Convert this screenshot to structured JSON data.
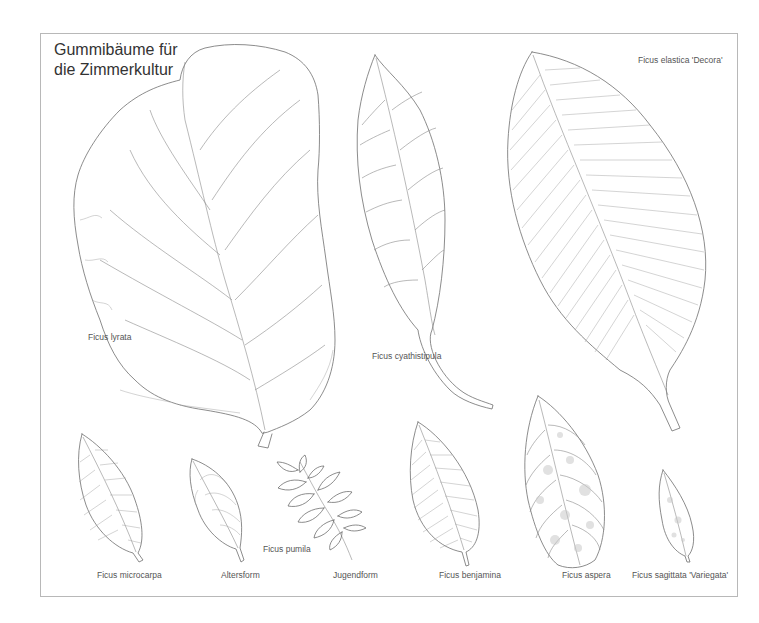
{
  "plate": {
    "title": "Gummibäume für\ndie Zimmerkultur",
    "border_color": "#b8b8b8",
    "line_color": "#6e6e6e"
  },
  "labels": {
    "lyrata": "Ficus lyrata",
    "cyathistipula": "Ficus cyathistipula",
    "elastica": "Ficus elastica 'Decora'",
    "microcarpa": "Ficus microcarpa",
    "altersform": "Altersform",
    "pumila": "Ficus pumila",
    "jugendform": "Jugendform",
    "benjamina": "Ficus benjamina",
    "aspera": "Ficus aspera",
    "sagittata": "Ficus sagittata 'Variegata'"
  },
  "illustrations": [
    {
      "id": "lyrata",
      "icon": "fiddle-leaf-icon"
    },
    {
      "id": "cyathistipula",
      "icon": "long-leaf-icon"
    },
    {
      "id": "elastica",
      "icon": "rubber-leaf-icon"
    },
    {
      "id": "microcarpa",
      "icon": "oval-leaf-icon"
    },
    {
      "id": "pumila-altersform",
      "icon": "small-leaf-icon"
    },
    {
      "id": "pumila-jugendform",
      "icon": "leafy-twig-icon"
    },
    {
      "id": "benjamina",
      "icon": "pointed-leaf-icon"
    },
    {
      "id": "aspera",
      "icon": "variegated-leaf-icon"
    },
    {
      "id": "sagittata",
      "icon": "narrow-leaf-icon"
    }
  ]
}
